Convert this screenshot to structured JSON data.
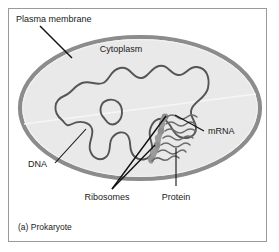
{
  "figure": {
    "caption": "(a) Prokaryote",
    "frame_color": "#9a9a9a",
    "background": "#ffffff"
  },
  "cell": {
    "membrane_color": "#8c8c8c",
    "membrane_inner_color": "#ffffff",
    "cytoplasm_color": "#e9e9e9",
    "dna_color": "#555555",
    "ribosome_color": "#9a9a9a",
    "mrna_color": "#6b6b6b"
  },
  "labels": {
    "plasma_membrane": "Plasma membrane",
    "cytoplasm": "Cytoplasm",
    "dna": "DNA",
    "mrna": "mRNA",
    "ribosomes": "Ribosomes",
    "protein": "Protein"
  }
}
